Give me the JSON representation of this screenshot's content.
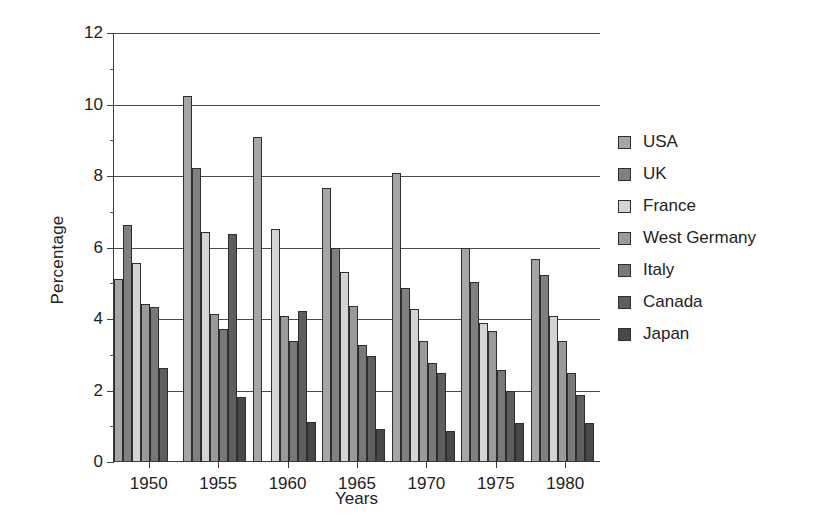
{
  "chart_data": {
    "type": "bar",
    "title": "",
    "xlabel": "Years",
    "ylabel": "Percentage",
    "ylim": [
      0,
      12
    ],
    "ytick_step": 2,
    "yticks": [
      0,
      2,
      4,
      6,
      8,
      10,
      12
    ],
    "ytick_labels": [
      "0",
      "2",
      "4",
      "6",
      "8",
      "10",
      "12"
    ],
    "categories": [
      "1950",
      "1955",
      "1960",
      "1965",
      "1970",
      "1975",
      "1980"
    ],
    "grid": true,
    "legend_position": "right",
    "series": [
      {
        "name": "USA",
        "color": "#a6a6a6",
        "values": [
          5.1,
          10.2,
          9.05,
          7.65,
          8.05,
          5.95,
          5.65
        ]
      },
      {
        "name": "UK",
        "color": "#808080",
        "values": [
          6.6,
          8.2,
          0.0,
          5.95,
          4.85,
          5.0,
          5.2
        ]
      },
      {
        "name": "France",
        "color": "#d4d4d4",
        "values": [
          5.55,
          6.4,
          6.5,
          5.3,
          4.25,
          3.85,
          4.05
        ]
      },
      {
        "name": "West Germany",
        "color": "#9a9a9a",
        "values": [
          4.4,
          4.1,
          4.05,
          4.35,
          3.35,
          3.65,
          3.35
        ]
      },
      {
        "name": "Italy",
        "color": "#787878",
        "values": [
          4.3,
          3.7,
          3.35,
          3.25,
          2.75,
          2.55,
          2.45
        ]
      },
      {
        "name": "Canada",
        "color": "#5e5e5e",
        "values": [
          2.6,
          6.35,
          4.2,
          2.95,
          2.45,
          1.95,
          1.85
        ]
      },
      {
        "name": "Japan",
        "color": "#484848",
        "values": [
          0.0,
          1.8,
          1.1,
          0.9,
          0.85,
          1.05,
          1.05
        ]
      }
    ]
  }
}
